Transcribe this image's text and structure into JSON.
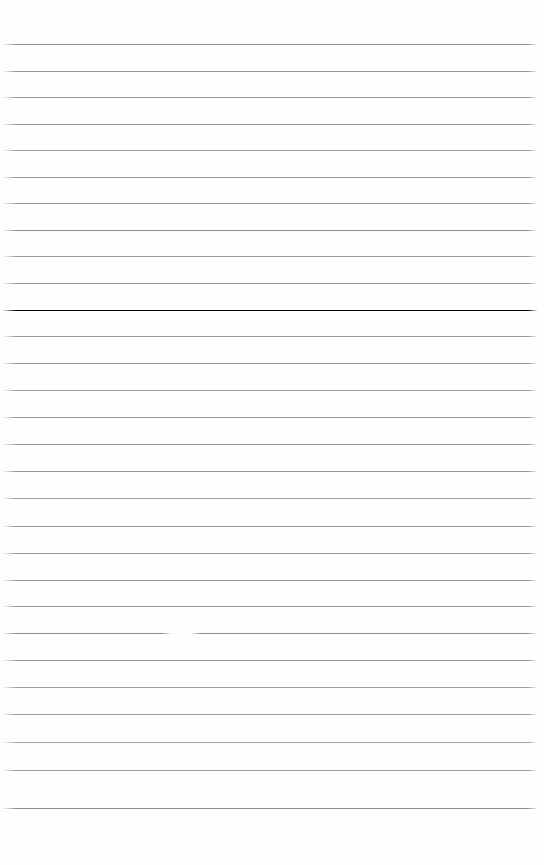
{
  "document": {
    "kind": "ruled-paper",
    "title": "",
    "body_text": "",
    "page_width": 544,
    "page_height": 865,
    "background_color": "#fefefe",
    "rule_color": "#9b9b9f",
    "rule_thickness": 1,
    "rule_left_x": 2,
    "rule_right_x": 538,
    "top_margin": 44,
    "bottom_margin": 57,
    "line_spacing": 26.5,
    "line_count": 29,
    "rules": [
      {
        "y": 44,
        "color": "#8e8e93"
      },
      {
        "y": 71,
        "color": "#96969a"
      },
      {
        "y": 97,
        "color": "#9a9a9e"
      },
      {
        "y": 124,
        "color": "#97979b"
      },
      {
        "y": 150,
        "color": "#9c9ca0"
      },
      {
        "y": 177,
        "color": "#939397"
      },
      {
        "y": 203,
        "color": "#9a9a9e"
      },
      {
        "y": 230,
        "color": "#909094"
      },
      {
        "y": 256,
        "color": "#9c9ca0"
      },
      {
        "y": 283,
        "color": "#95959a"
      },
      {
        "y": 310,
        "color": "#999 9d"
      },
      {
        "y": 336,
        "color": "#9a9a9e"
      },
      {
        "y": 363,
        "color": "#939397"
      },
      {
        "y": 390,
        "color": "#9d9da1"
      },
      {
        "y": 417,
        "color": "#96969a"
      },
      {
        "y": 444,
        "color": "#9a9a9e"
      },
      {
        "y": 471,
        "color": "#939398"
      },
      {
        "y": 498,
        "color": "#9c9ca0"
      },
      {
        "y": 526,
        "color": "#97979b"
      },
      {
        "y": 553,
        "color": "#9a9a9e"
      },
      {
        "y": 580,
        "color": "#949498"
      },
      {
        "y": 606,
        "color": "#9b9b9f"
      },
      {
        "y": 633,
        "color": "#8f8f94"
      },
      {
        "y": 660,
        "color": "#9b9b9f"
      },
      {
        "y": 687,
        "color": "#a0a0a4"
      },
      {
        "y": 714,
        "color": "#97979b"
      },
      {
        "y": 742,
        "color": "#a2a2a6"
      },
      {
        "y": 770,
        "color": "#95959a"
      },
      {
        "y": 808,
        "color": "#8d8d92"
      }
    ],
    "anomalies": [
      {
        "name": "line-break-gap",
        "on_rule_y": 633,
        "x": 172,
        "width": 18,
        "description": "small erased break in the rule"
      }
    ]
  }
}
